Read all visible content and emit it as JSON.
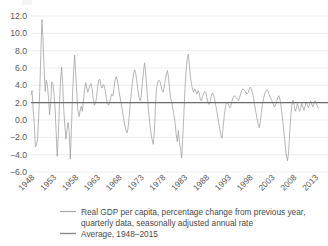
{
  "chart_data": {
    "type": "line",
    "title": "",
    "xlabel": "",
    "ylabel": "",
    "ylim": [
      -6.0,
      12.0
    ],
    "xlim": [
      1948,
      2016
    ],
    "grid": true,
    "legend_position": "bottom",
    "ytick_labels": [
      "12.0",
      "10.0",
      "8.0",
      "6.0",
      "4.0",
      "2.0",
      "0.0",
      "-2.0",
      "-4.0",
      "-6.0"
    ],
    "ytick_values": [
      12.0,
      10.0,
      8.0,
      6.0,
      4.0,
      2.0,
      0.0,
      -2.0,
      -4.0,
      -6.0
    ],
    "xtick_labels": [
      "1948",
      "1953",
      "1958",
      "1963",
      "1968",
      "1973",
      "1978",
      "1983",
      "1988",
      "1993",
      "1998",
      "2003",
      "2008",
      "2013"
    ],
    "xtick_values": [
      1948,
      1953,
      1958,
      1963,
      1968,
      1973,
      1978,
      1983,
      1988,
      1993,
      1998,
      2003,
      2008,
      2013
    ],
    "series": [
      {
        "name": "Real GDP per capita, percentage change from previous year, quarterly data, seasonally adjusted annual rate",
        "color": "#9d9d9d",
        "x_start": 1948.0,
        "x_step": 0.25,
        "values": [
          2.9,
          3.4,
          1.1,
          -0.4,
          -3.1,
          -2.9,
          -2.3,
          0.3,
          3.3,
          7.6,
          11.6,
          9.2,
          6.0,
          3.3,
          4.6,
          4.0,
          2.6,
          0.6,
          1.9,
          4.4,
          4.2,
          3.1,
          1.5,
          -1.3,
          -4.2,
          -1.8,
          1.5,
          4.4,
          6.1,
          4.3,
          1.2,
          -0.7,
          -2.2,
          -1.1,
          -0.3,
          -1.4,
          -4.5,
          -1.2,
          2.8,
          5.6,
          7.5,
          5.2,
          3.0,
          1.0,
          0.4,
          1.1,
          1.6,
          1.0,
          2.2,
          3.4,
          4.3,
          3.8,
          3.2,
          3.6,
          4.0,
          4.2,
          3.6,
          2.4,
          1.7,
          1.9,
          2.6,
          3.8,
          4.6,
          4.7,
          4.0,
          3.7,
          4.1,
          4.0,
          3.3,
          2.5,
          1.9,
          1.7,
          2.0,
          2.6,
          3.0,
          2.8,
          3.7,
          4.6,
          5.0,
          4.6,
          3.9,
          3.0,
          2.3,
          1.6,
          0.8,
          0.0,
          -0.6,
          -1.2,
          -1.5,
          -0.8,
          0.5,
          2.1,
          3.3,
          4.5,
          5.4,
          5.8,
          5.3,
          4.4,
          3.4,
          2.6,
          2.2,
          2.8,
          4.2,
          5.6,
          6.6,
          5.5,
          3.8,
          2.0,
          0.6,
          -0.7,
          -1.6,
          -2.3,
          -2.8,
          -1.4,
          1.6,
          3.7,
          4.3,
          4.6,
          4.5,
          4.0,
          3.4,
          3.2,
          3.8,
          4.6,
          5.3,
          5.7,
          4.8,
          3.4,
          2.5,
          2.0,
          1.2,
          0.5,
          -0.4,
          -1.7,
          -2.5,
          -1.2,
          -2.6,
          -3.4,
          -4.4,
          -2.0,
          0.6,
          3.6,
          5.6,
          7.0,
          7.6,
          6.4,
          5.0,
          4.1,
          3.5,
          3.2,
          3.6,
          3.3,
          3.0,
          3.4,
          3.1,
          2.4,
          2.2,
          2.7,
          3.0,
          3.3,
          3.2,
          2.6,
          2.0,
          1.8,
          2.1,
          2.7,
          3.1,
          3.0,
          2.5,
          1.8,
          1.2,
          0.4,
          -0.4,
          -1.1,
          -1.8,
          -2.1,
          -0.8,
          0.5,
          1.5,
          2.0,
          2.0,
          1.7,
          1.4,
          1.6,
          2.1,
          2.6,
          2.8,
          2.7,
          2.6,
          2.4,
          2.2,
          2.6,
          3.0,
          3.4,
          3.6,
          3.5,
          3.3,
          3.1,
          3.0,
          3.2,
          3.6,
          3.8,
          3.5,
          3.0,
          2.4,
          1.6,
          0.9,
          0.2,
          -0.5,
          -0.9,
          -0.2,
          0.9,
          1.8,
          2.5,
          3.0,
          3.3,
          3.5,
          3.4,
          3.0,
          2.6,
          2.4,
          2.1,
          1.8,
          1.5,
          1.7,
          2.1,
          2.6,
          2.8,
          2.4,
          1.6,
          0.6,
          -0.6,
          -1.8,
          -3.2,
          -4.3,
          -4.7,
          -3.6,
          -1.4,
          0.6,
          1.8,
          2.3,
          1.7,
          1.0,
          1.3,
          1.9,
          1.4,
          1.0,
          1.4,
          1.9,
          1.5,
          1.1,
          1.6,
          2.1,
          1.8,
          1.4,
          1.7,
          2.2,
          1.9,
          1.5,
          1.8,
          2.2,
          2.0,
          1.7,
          1.4
        ]
      }
    ],
    "average_line": {
      "name": "Average, 1948–2015",
      "value": 2.0,
      "color": "#6b6b6b"
    }
  },
  "legend": {
    "items": [
      {
        "label_line1": "Real GDP per capita, percentage change from previous year,",
        "label_line2": "quarterly data, seasonally adjusted annual rate",
        "swatch": "series-line-swatch"
      },
      {
        "label_line1": "Average, 1948–2015",
        "label_line2": "",
        "swatch": "average-line-swatch"
      }
    ]
  }
}
